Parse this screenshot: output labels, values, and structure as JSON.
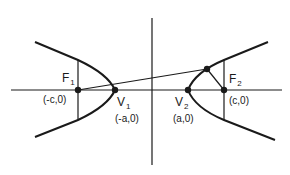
{
  "diagram": {
    "type": "hyperbola-foci",
    "colors": {
      "stroke": "#1a1a1a",
      "background": "#ffffff"
    },
    "points": {
      "F1": {
        "label": "F",
        "sub": "1",
        "coord": "(-c,0)"
      },
      "V1": {
        "label": "V",
        "sub": "1",
        "coord": "(-a,0)"
      },
      "V2": {
        "label": "V",
        "sub": "2",
        "coord": "(a,0)"
      },
      "F2": {
        "label": "F",
        "sub": "2",
        "coord": "(c,0)"
      }
    }
  }
}
